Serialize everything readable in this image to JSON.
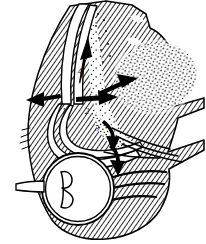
{
  "figure": {
    "type": "line-illustration",
    "background_color": "#ffffff",
    "ink_color": "#000000",
    "hatch_color": "#2b2b2b",
    "stipple_color": "#1a1a1a",
    "width": 206,
    "height": 244
  },
  "labels": [
    {
      "id": "label-1",
      "text": "1",
      "x": 64,
      "y": 112
    },
    {
      "id": "label-2",
      "text": "2",
      "x": 87,
      "y": 112
    },
    {
      "id": "label-3",
      "text": "3",
      "x": 97,
      "y": 129
    },
    {
      "id": "label-4",
      "text": "4",
      "x": 80,
      "y": 72
    }
  ],
  "arrows": [
    {
      "id": "arrow-up",
      "direction": "up",
      "description": "superior spread arrow"
    },
    {
      "id": "arrow-left",
      "direction": "left",
      "description": "medial spread arrow"
    },
    {
      "id": "arrow-right",
      "direction": "right",
      "description": "lateral spread arrow"
    },
    {
      "id": "arrow-diagonal-up-right",
      "direction": "up-right",
      "description": "arrow pointing into stippled mass"
    },
    {
      "id": "arrow-curve-down",
      "direction": "down",
      "description": "curved inferior spread arrow"
    },
    {
      "id": "arrow-curve-down-2",
      "direction": "down",
      "description": "second curved inferior arrow toward globe"
    }
  ],
  "regions": [
    {
      "id": "stippled-mass",
      "name": "stippled oval mass",
      "fill": "stipple"
    },
    {
      "id": "hatched-tissue",
      "name": "hatched soft tissue",
      "fill": "diagonal-hatch"
    },
    {
      "id": "eye-globe",
      "name": "eye globe",
      "fill": "white"
    },
    {
      "id": "optic-nerve",
      "name": "optic nerve",
      "fill": "white"
    }
  ]
}
